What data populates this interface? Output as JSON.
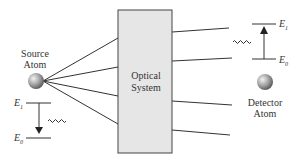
{
  "diagram": {
    "source": {
      "label_line1": "Source",
      "label_line2": "Atom"
    },
    "detector": {
      "label_line1": "Detector",
      "label_line2": "Atom"
    },
    "optical_system": {
      "label_line1": "Optical",
      "label_line2": "System"
    },
    "source_levels": {
      "upper": "E",
      "upper_sub": "1",
      "lower": "E",
      "lower_sub": "0",
      "transition": "emission (downward arrow)"
    },
    "detector_levels": {
      "upper": "E",
      "upper_sub": "1",
      "lower": "E",
      "lower_sub": "0",
      "transition": "absorption (upward arrow)"
    },
    "colors": {
      "box_fill": "#e6e6e6",
      "box_stroke": "#444444",
      "line": "#333333",
      "atom": "#888888"
    }
  }
}
